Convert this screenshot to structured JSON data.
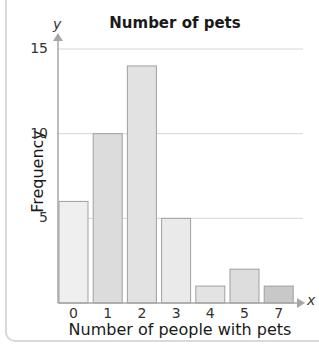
{
  "chart_data": {
    "type": "bar",
    "title": "Number of pets",
    "xlabel": "Number of people with pets",
    "ylabel": "Frequency",
    "x_axis_symbol": "x",
    "y_axis_symbol": "y",
    "categories": [
      "0",
      "1",
      "2",
      "3",
      "4",
      "5",
      "7"
    ],
    "values": [
      6,
      10,
      14,
      5,
      1,
      2,
      1
    ],
    "ylim": [
      0,
      15
    ],
    "yticks": [
      5,
      10,
      15
    ],
    "grid": true,
    "legend": null,
    "bar_colors": [
      "#efefef",
      "#dcdcdc",
      "#e2e2e2",
      "#eaeaea",
      "#e3e3e3",
      "#dddddd",
      "#c8c8c8"
    ]
  },
  "colors": {
    "axis": "#a6a6a6",
    "grid": "#d6d6d6",
    "bar_stroke": "#a0a0a0"
  }
}
